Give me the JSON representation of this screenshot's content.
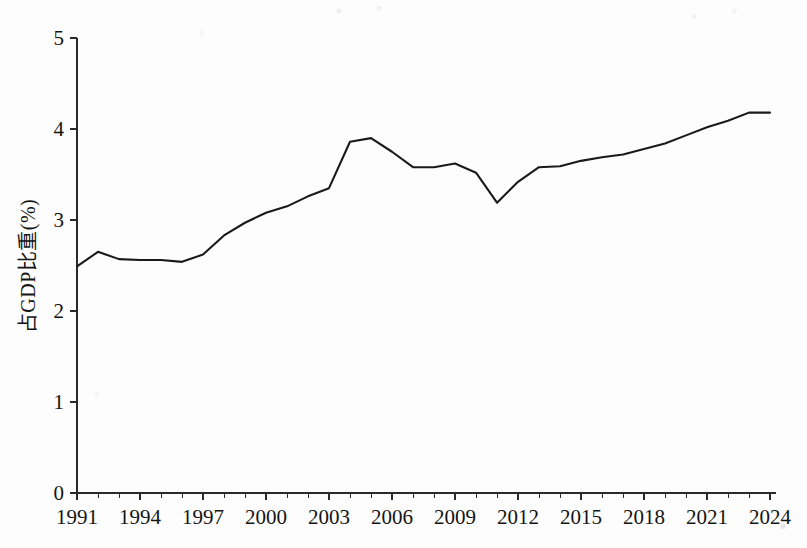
{
  "chart_data": {
    "type": "line",
    "title": "",
    "subtitle": "",
    "xlabel": "",
    "ylabel": "占GDP比重(%)",
    "xlim": [
      1991,
      2024
    ],
    "ylim": [
      0,
      5
    ],
    "grid": false,
    "legend": null,
    "legend_position": "none",
    "line_color": "#1a1a1a",
    "background_color": "#fdfdfd",
    "axis_color": "#2a2a2a",
    "x": [
      1991,
      1992,
      1993,
      1994,
      1995,
      1996,
      1997,
      1998,
      1999,
      2000,
      2001,
      2002,
      2003,
      2004,
      2005,
      2006,
      2007,
      2008,
      2009,
      2010,
      2011,
      2012,
      2013,
      2014,
      2015,
      2016,
      2017,
      2018,
      2019,
      2020,
      2021,
      2022,
      2023,
      2024
    ],
    "values": [
      2.49,
      2.65,
      2.57,
      2.56,
      2.56,
      2.54,
      2.62,
      2.83,
      2.97,
      3.08,
      3.15,
      3.26,
      3.35,
      3.86,
      3.9,
      3.75,
      3.58,
      3.58,
      3.62,
      3.52,
      3.19,
      3.42,
      3.58,
      3.59,
      3.65,
      3.69,
      3.72,
      3.78,
      3.84,
      3.93,
      4.02,
      4.09,
      4.18,
      4.18
    ],
    "y_ticks": [
      0,
      1,
      2,
      3,
      4,
      5
    ],
    "y_tick_labels": [
      "0",
      "1",
      "2",
      "3",
      "4",
      "5"
    ],
    "x_ticks": [
      1991,
      1994,
      1997,
      2000,
      2003,
      2006,
      2009,
      2012,
      2015,
      2018,
      2021,
      2024
    ],
    "x_tick_labels": [
      "1991",
      "1994",
      "1997",
      "2000",
      "2003",
      "2006",
      "2009",
      "2012",
      "2015",
      "2018",
      "2021",
      "2024"
    ],
    "x_minor_tick_interval": 1,
    "spines": [
      "left",
      "bottom"
    ],
    "annotations": []
  }
}
